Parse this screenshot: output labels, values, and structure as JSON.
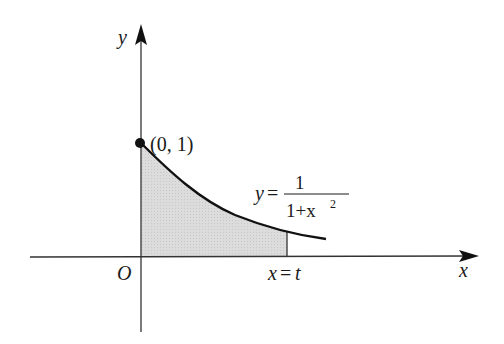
{
  "diagram": {
    "type": "function-graph",
    "function": "y = 1/(1+x^2)",
    "labels": {
      "y_axis": "y",
      "x_axis": "x",
      "origin": "O",
      "point": "(0, 1)",
      "curve_lhs": "y",
      "curve_eq": "=",
      "curve_num": "1",
      "curve_den_base": "1+x",
      "curve_den_exp": "2",
      "boundary_lhs": "x",
      "boundary_eq": "=",
      "boundary_rhs": "t"
    },
    "shaded_region": "area under curve from x=0 to x=t",
    "colors": {
      "axis": "#333333",
      "curve": "#111111",
      "shade": "#d9d9d9",
      "point": "#111111"
    }
  }
}
